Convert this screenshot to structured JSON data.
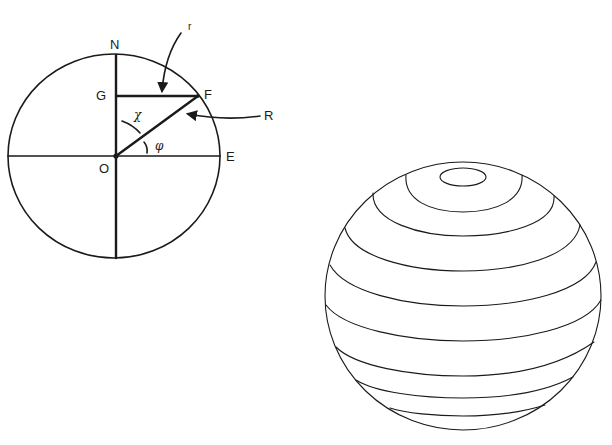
{
  "figure": {
    "left_diagram": {
      "description": "Circular cross-section of a sphere with axes and radius construction",
      "labels": {
        "north": "N",
        "east": "E",
        "origin": "O",
        "g_point": "G",
        "f_point": "F",
        "small_r": "r",
        "big_r": "R",
        "chi": "χ",
        "phi": "φ"
      }
    },
    "right_diagram": {
      "description": "Sphere drawn with latitude bands (parallels)",
      "band_count": 8,
      "has_polar_cap": true
    },
    "colors": {
      "line": "#1a1a1a",
      "background": "#ffffff"
    }
  }
}
